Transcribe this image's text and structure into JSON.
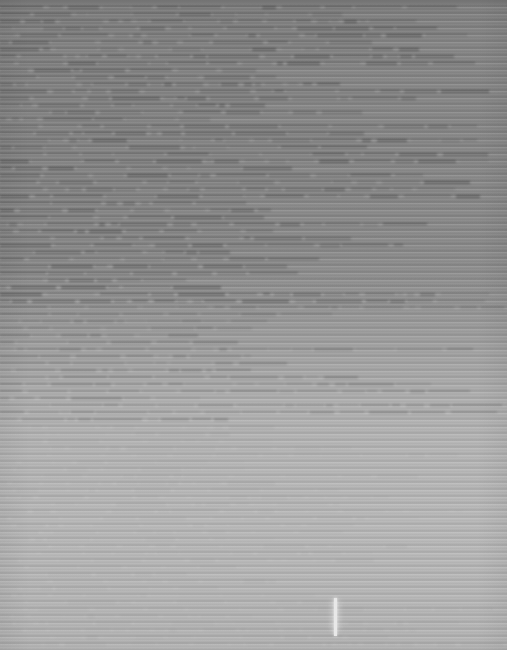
{
  "capture": {
    "title": "Degraded screen capture",
    "width_px": 507,
    "height_px": 650,
    "legibility": "no-legible-text",
    "description": "Horizontally striped scanline capture; text rows are unresolvable at source resolution."
  },
  "colors": {
    "upper_band_base": "#888888",
    "upper_band_stripe_dark": "#7a7a7a",
    "lower_band_base": "#b8b8b8",
    "lower_band_stripe_light": "#c4c4c4",
    "top_header_band": "#747474",
    "caret": "#e8e8e8",
    "text_smear": "#5f5f5f"
  },
  "regions": [
    {
      "name": "top-header-band",
      "y": 0,
      "height": 4,
      "shade": "#747474",
      "label": ""
    },
    {
      "name": "dense-text-band",
      "y": 4,
      "height": 300,
      "shade": "#888888",
      "label": "",
      "line_count": 43,
      "line_pitch_px": 7
    },
    {
      "name": "transition-band",
      "y": 304,
      "height": 120,
      "shade": "#a3a3a3",
      "label": "",
      "line_count": 17,
      "line_pitch_px": 7
    },
    {
      "name": "blank-lower-band",
      "y": 424,
      "height": 226,
      "shade": "#b8b8b8",
      "label": "",
      "line_count": 32,
      "line_pitch_px": 7
    }
  ],
  "caret": {
    "name": "text-cursor",
    "x": 334,
    "y": 598,
    "width": 3,
    "height": 38,
    "color": "#e8e8e8",
    "state": "visible"
  },
  "scanlines": {
    "period_px": 7,
    "orientation": "horizontal",
    "coverage": "full-bleed"
  }
}
